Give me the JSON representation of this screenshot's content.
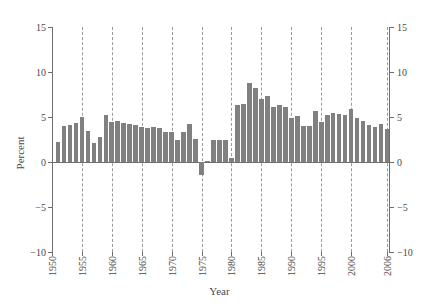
{
  "chart_data": {
    "type": "bar",
    "title": "",
    "xlabel": "Year",
    "ylabel": "Percent",
    "ylim": [
      -10,
      15
    ],
    "xlim": [
      1950,
      2006.5
    ],
    "yticks": [
      15,
      10,
      5,
      0,
      -5,
      -10
    ],
    "ytick_labels": [
      "15",
      "10",
      "5",
      "0",
      "−5",
      "−10"
    ],
    "right_axis": true,
    "right_ytick_labels": [
      "15",
      "10",
      "5",
      "0",
      "−5",
      "−10"
    ],
    "xticks": [
      1950,
      1955,
      1960,
      1965,
      1970,
      1975,
      1980,
      1985,
      1990,
      1995,
      2000,
      2006
    ],
    "xtick_labels": [
      "1950",
      "1955",
      "1960",
      "1965",
      "1970",
      "1975",
      "1980",
      "1985",
      "1990",
      "1995",
      "2000",
      "2006"
    ],
    "grid": "vertical-dashed",
    "legend": null,
    "bar_color": "#808080",
    "axis_color": "#6e6e6e",
    "grid_color": "#9a9a9a",
    "background": "#ffffff",
    "x": [
      1951,
      1952,
      1953,
      1954,
      1955,
      1956,
      1957,
      1958,
      1959,
      1960,
      1961,
      1962,
      1963,
      1964,
      1965,
      1966,
      1967,
      1968,
      1969,
      1970,
      1971,
      1972,
      1973,
      1974,
      1975,
      1976,
      1977,
      1978,
      1979,
      1980,
      1981,
      1982,
      1983,
      1984,
      1985,
      1986,
      1987,
      1988,
      1989,
      1990,
      1991,
      1992,
      1993,
      1994,
      1995,
      1996,
      1997,
      1998,
      1999,
      2000,
      2001,
      2002,
      2003,
      2004,
      2005,
      2006
    ],
    "values": [
      2.2,
      4.0,
      4.1,
      4.3,
      5.0,
      3.4,
      2.1,
      2.8,
      5.2,
      4.4,
      4.6,
      4.3,
      4.2,
      4.1,
      3.9,
      3.8,
      3.9,
      3.8,
      3.3,
      3.3,
      2.4,
      3.3,
      4.2,
      2.6,
      -1.4,
      0.1,
      2.5,
      2.5,
      2.5,
      0.5,
      6.3,
      6.4,
      8.8,
      8.2,
      7.0,
      7.3,
      6.1,
      6.3,
      6.1,
      4.9,
      5.1,
      4.0,
      4.0,
      5.7,
      4.5,
      5.2,
      5.5,
      5.3,
      5.2,
      5.9,
      4.9,
      4.6,
      4.1,
      3.9,
      4.2,
      3.7
    ]
  }
}
